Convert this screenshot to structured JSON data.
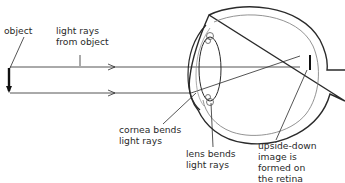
{
  "diagram": {
    "colors": {
      "line": "#2a2a2a",
      "inner_line": "#6a6a6a",
      "background": "#ffffff"
    },
    "labels": {
      "object": "object",
      "light_rays": "light rays\nfrom object",
      "cornea": "cornea bends\nlight rays",
      "lens": "lens bends\nlight rays",
      "retina": "upside-down\nimage is\nformed on\nthe retina"
    }
  }
}
